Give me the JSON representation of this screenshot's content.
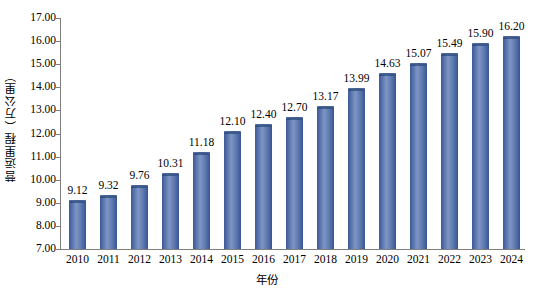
{
  "chart_data": {
    "type": "bar",
    "title": "",
    "xlabel": "年份",
    "ylabel": "营运里程（万公里）",
    "categories": [
      "2010",
      "2011",
      "2012",
      "2013",
      "2014",
      "2015",
      "2016",
      "2017",
      "2018",
      "2019",
      "2020",
      "2021",
      "2022",
      "2023",
      "2024"
    ],
    "values": [
      9.12,
      9.32,
      9.76,
      10.31,
      11.18,
      12.1,
      12.4,
      12.7,
      13.17,
      13.99,
      14.63,
      15.07,
      15.49,
      15.9,
      16.2
    ],
    "value_labels": [
      "9.12",
      "9.32",
      "9.76",
      "10.31",
      "11.18",
      "12.10",
      "12.40",
      "12.70",
      "13.17",
      "13.99",
      "14.63",
      "15.07",
      "15.49",
      "15.90",
      "16.20"
    ],
    "ylim": [
      7.0,
      17.0
    ],
    "ytick_labels": [
      "17.00",
      "16.00",
      "15.00",
      "14.00",
      "13.00",
      "12.00",
      "11.00",
      "10.00",
      "9.00",
      "8.00",
      "7.00"
    ],
    "ytick_values": [
      17.0,
      16.0,
      15.0,
      14.0,
      13.0,
      12.0,
      11.0,
      10.0,
      9.0,
      8.0,
      7.0
    ],
    "grid": false,
    "legend": null,
    "series_color": "#5b7ab5",
    "axis_color": "#7f7f7f"
  }
}
